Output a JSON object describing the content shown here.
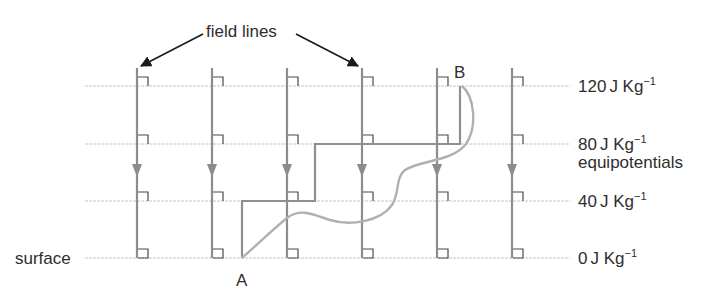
{
  "labels": {
    "field_lines": "field lines",
    "surface": "surface",
    "equipotentials": "equipotentials",
    "point_a": "A",
    "point_b": "B"
  },
  "equipotentials": [
    {
      "value": "120",
      "unit": "J Kg",
      "exp": "−1",
      "y": 86
    },
    {
      "value": "80",
      "unit": "J Kg",
      "exp": "−1",
      "y": 144
    },
    {
      "value": "40",
      "unit": "J Kg",
      "exp": "−1",
      "y": 201
    },
    {
      "value": "0",
      "unit": "J Kg",
      "exp": "−1",
      "y": 258
    }
  ],
  "field_line_x": [
    137,
    212,
    287,
    362,
    437,
    512
  ],
  "colors": {
    "field_line": "#8c8c8c",
    "equipotential": "#c4c4c4",
    "path": "#8f8f8f",
    "curve": "#b0b0b0",
    "marker": "#4a4a4a",
    "annotation": "#1a1a1a"
  }
}
